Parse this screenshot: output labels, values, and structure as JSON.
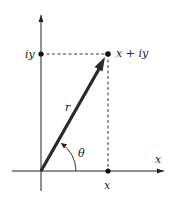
{
  "diagram": {
    "labels": {
      "imag_axis_point": "iy",
      "point": "x + iy",
      "magnitude": "r",
      "angle": "θ",
      "real_axis": "x",
      "real_axis_point": "x"
    },
    "colors": {
      "ink": "#222222",
      "vector": "#2a2a2a",
      "background": "#ffffff"
    },
    "geometry": {
      "origin": [
        41,
        171
      ],
      "point": [
        108,
        54
      ],
      "x_axis_end": 164,
      "y_axis_top": 15
    }
  }
}
